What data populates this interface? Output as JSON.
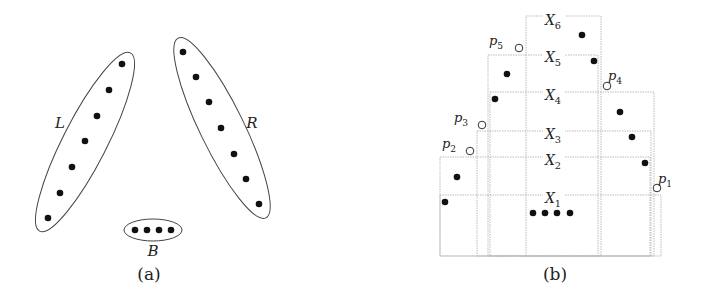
{
  "panel_a": {
    "caption": "(a)",
    "groups": [
      {
        "label": "L",
        "label_pos": [
          60,
          128
        ],
        "ellipse": {
          "cx": 85,
          "cy": 142,
          "rx": 22,
          "ry": 100,
          "rot": 27
        },
        "points": [
          [
            122,
            64
          ],
          [
            109,
            90
          ],
          [
            97,
            116
          ],
          [
            85,
            141
          ],
          [
            72,
            167
          ],
          [
            60,
            193
          ],
          [
            48,
            218
          ]
        ]
      },
      {
        "label": "R",
        "label_pos": [
          252,
          128
        ],
        "ellipse": {
          "cx": 222,
          "cy": 128,
          "rx": 22,
          "ry": 100,
          "rot": -26
        },
        "points": [
          [
            183,
            52
          ],
          [
            196,
            77
          ],
          [
            209,
            102
          ],
          [
            221,
            128
          ],
          [
            234,
            154
          ],
          [
            246,
            179
          ],
          [
            259,
            204
          ]
        ]
      },
      {
        "label": "B",
        "label_pos": [
          153,
          256
        ],
        "ellipse": {
          "cx": 153,
          "cy": 230,
          "rx": 29,
          "ry": 11,
          "rot": 0
        },
        "points": [
          [
            135,
            230
          ],
          [
            147,
            230
          ],
          [
            159,
            230
          ],
          [
            171,
            230
          ]
        ]
      }
    ],
    "caption_pos": [
      149,
      280
    ]
  },
  "panel_b": {
    "caption": "(b)",
    "caption_pos": [
      555,
      280
    ],
    "boxes": [
      {
        "label": "X",
        "sub": "6",
        "x": 526,
        "y": 16,
        "w": 75,
        "h": 240,
        "label_pos": [
          553,
          25
        ]
      },
      {
        "label": "X",
        "sub": "5",
        "x": 488,
        "y": 55,
        "w": 110,
        "h": 201,
        "label_pos": [
          553,
          62
        ]
      },
      {
        "label": "X",
        "sub": "4",
        "x": 490,
        "y": 92,
        "w": 164,
        "h": 164,
        "label_pos": [
          553,
          100
        ]
      },
      {
        "label": "X",
        "sub": "3",
        "x": 477,
        "y": 131,
        "w": 174,
        "h": 125,
        "label_pos": [
          553,
          139
        ]
      },
      {
        "label": "X",
        "sub": "2",
        "x": 440,
        "y": 157,
        "w": 210,
        "h": 99,
        "label_pos": [
          553,
          165
        ]
      },
      {
        "label": "X",
        "sub": "1",
        "x": 440,
        "y": 195,
        "w": 221,
        "h": 61,
        "label_pos": [
          553,
          203
        ]
      }
    ],
    "filled_points": [
      [
        582,
        35
      ],
      [
        594,
        61
      ],
      [
        507,
        74
      ],
      [
        495,
        99
      ],
      [
        620,
        112
      ],
      [
        632,
        137
      ],
      [
        645,
        163
      ],
      [
        457,
        177
      ],
      [
        445,
        202
      ],
      [
        533,
        213
      ],
      [
        545,
        213
      ],
      [
        557,
        213
      ],
      [
        570,
        213
      ]
    ],
    "hollow_points": [
      {
        "label": "p",
        "sub": "5",
        "pt": [
          519,
          48
        ],
        "label_pos": [
          496,
          45
        ]
      },
      {
        "label": "p",
        "sub": "4",
        "pt": [
          607,
          86
        ],
        "label_pos": [
          615,
          80
        ]
      },
      {
        "label": "p",
        "sub": "3",
        "pt": [
          482,
          125
        ],
        "label_pos": [
          461,
          122
        ]
      },
      {
        "label": "p",
        "sub": "2",
        "pt": [
          470,
          151
        ],
        "label_pos": [
          449,
          148
        ]
      },
      {
        "label": "p",
        "sub": "1",
        "pt": [
          657,
          188
        ],
        "label_pos": [
          665,
          183
        ]
      }
    ]
  }
}
